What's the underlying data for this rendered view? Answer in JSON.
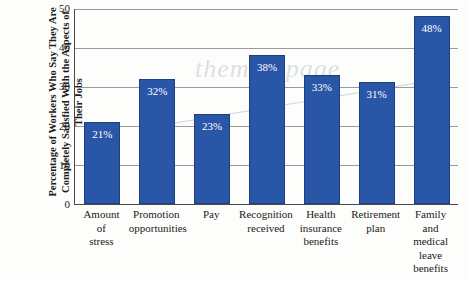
{
  "chart_data": {
    "type": "bar",
    "title": "",
    "xlabel": "",
    "ylabel": "Percentage of Workers Who Say They Are Completely Satisfied With the Aspects of Their Jobs",
    "ylim": [
      0,
      50
    ],
    "yticks": [
      "0",
      "10",
      "20",
      "30",
      "40",
      "50"
    ],
    "grid": true,
    "legend": "none",
    "categories": [
      "Amount\nof\nstress",
      "Promotion\nopportunities",
      "Pay",
      "Recognition\nreceived",
      "Health\ninsurance\nbenefits",
      "Retirement\nplan",
      "Family\nand\nmedical\nleave benefits"
    ],
    "category_lines": [
      [
        "Amount",
        "of",
        "stress"
      ],
      [
        "Promotion",
        "opportunities"
      ],
      [
        "Pay"
      ],
      [
        "Recognition",
        "received"
      ],
      [
        "Health",
        "insurance",
        "benefits"
      ],
      [
        "Retirement",
        "plan"
      ],
      [
        "Family",
        "and",
        "medical",
        "leave benefits"
      ]
    ],
    "values": [
      21,
      32,
      23,
      38,
      33,
      31,
      48
    ],
    "value_labels": [
      "21%",
      "32%",
      "23%",
      "38%",
      "33%",
      "31%",
      "48%"
    ],
    "bar_color": "#2a56a8",
    "watermark": "themathpage"
  }
}
